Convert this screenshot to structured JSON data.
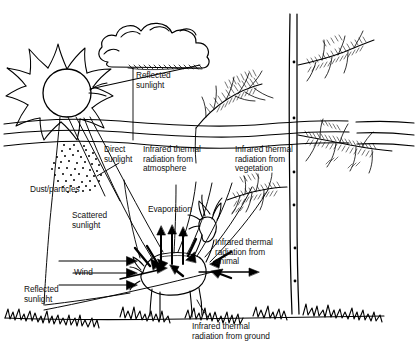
{
  "diagram": {
    "background_color": "#ffffff",
    "ink_color": "#000000",
    "style": "hand-drawn line sketch"
  },
  "labels": {
    "reflected_sunlight_cloud": "Reflected\nsunlight",
    "direct_sunlight": "Direct\nsunlight",
    "infrared_atmosphere": "Infrared thermal\nradiation from\natmosphere",
    "infrared_vegetation": "Infrared thermal\nradiation from\nvegetation",
    "dust_particles": "Dust/particles",
    "scattered_sunlight": "Scattered\nsunlight",
    "evaporation": "Evaporation",
    "wind": "Wind",
    "reflected_sunlight_ground": "Reflected\nsunlight",
    "infrared_animal": "Infrared thermal\nradiation from\nanimal",
    "infrared_ground": "Infrared thermal\nradiation from ground"
  },
  "elements": {
    "sun": "sun-with-rays",
    "cloud": "cumulus-cloud",
    "atmosphere_layers": 3,
    "dust_cloud": "stippled-dust-patch",
    "animal": "deer",
    "trees": [
      "pine-branch-left",
      "tall-pine-right"
    ],
    "ground": "scribbled-grass-line",
    "evaporation_arrows": 3,
    "wind_arrows": 3
  }
}
